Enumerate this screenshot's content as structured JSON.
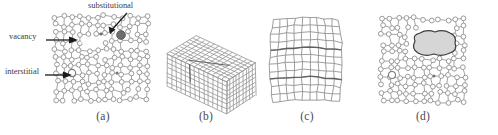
{
  "figure": {
    "kind": "crystal-defect-diagram",
    "width": 498,
    "height": 135,
    "background": "#ffffff",
    "line_color": "#8a8a8a",
    "label_color": "#3a3a3a",
    "blob_fill": "#d6d6d6",
    "blob_stroke": "#3c3c3c",
    "substitutional_fill": "#6e6e6e"
  },
  "annotations": {
    "substitutional": "substitutional",
    "vacancy": "vacancy",
    "interstitial": "interstitial"
  },
  "panels": [
    {
      "id": "a",
      "caption": "(a)",
      "content": "point-defect-lattice"
    },
    {
      "id": "b",
      "caption": "(b)",
      "content": "3d-grid-block"
    },
    {
      "id": "c",
      "caption": "(c)",
      "content": "distorted-2d-grid"
    },
    {
      "id": "d",
      "caption": "(d)",
      "content": "lattice-with-void"
    }
  ]
}
